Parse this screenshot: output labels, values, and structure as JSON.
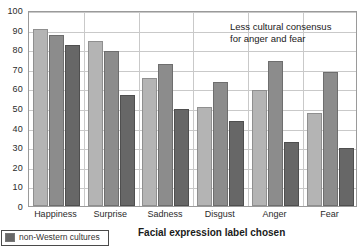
{
  "chart_data": {
    "type": "bar",
    "title": "",
    "xlabel": "Facial expression label chosen",
    "ylabel": "",
    "ylim": [
      0,
      100
    ],
    "yticks": [
      0,
      10,
      20,
      30,
      40,
      50,
      60,
      70,
      80,
      90,
      100
    ],
    "grid": "horizontal-and-vertical",
    "legend_position": "bottom-left",
    "categories": [
      "Happiness",
      "Surprise",
      "Sadness",
      "Disgust",
      "Anger",
      "Fear"
    ],
    "series": [
      {
        "name": "Western cultures",
        "color": "#b4b4b4",
        "values": [
          91,
          85,
          66,
          51,
          60,
          48
        ]
      },
      {
        "name": "non-Western literate cultures",
        "color": "#8c8c8c",
        "values": [
          88,
          80,
          73,
          64,
          75,
          69
        ]
      },
      {
        "name": "non-Western cultures",
        "color": "#676767",
        "values": [
          83,
          57,
          50,
          44,
          33,
          30
        ]
      }
    ],
    "annotations": [
      {
        "text_line1": "Less cultural consensus",
        "text_line2": "for anger and fear"
      }
    ]
  },
  "axis": {
    "y_tick_labels": [
      "100",
      "90",
      "80",
      "70",
      "60",
      "50",
      "40",
      "30",
      "20",
      "10",
      "0"
    ],
    "x_tick_labels": [
      "Happiness",
      "Surprise",
      "Sadness",
      "Disgust",
      "Anger",
      "Fear"
    ],
    "x_title": "Facial expression label chosen"
  },
  "annotation": {
    "line1": "Less cultural consensus",
    "line2": "for anger and fear"
  },
  "legend": {
    "items": [
      {
        "label": "non-Western cultures"
      }
    ]
  }
}
